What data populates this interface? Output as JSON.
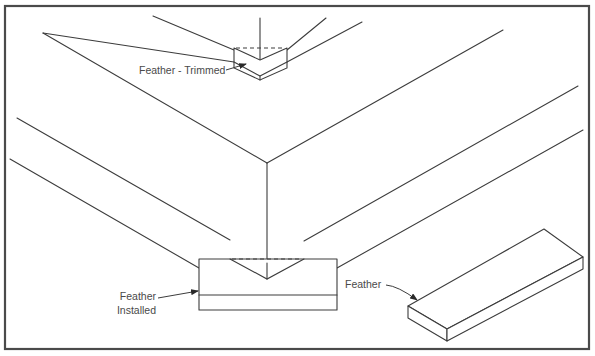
{
  "diagram": {
    "type": "isometric technical drawing",
    "labels": {
      "feather_trimmed": "Feather - Trimmed",
      "feather_installed_line1": "Feather",
      "feather_installed_line2": "Installed",
      "feather": "Feather"
    },
    "colors": {
      "line": "#3c3c3c",
      "frame": "#4a4a4a",
      "text": "#4a4a4a",
      "background": "#ffffff"
    }
  }
}
